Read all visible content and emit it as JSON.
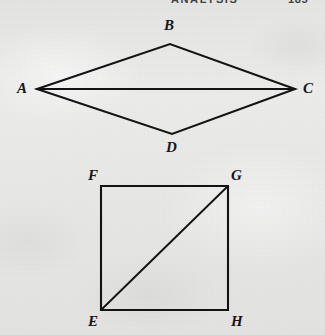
{
  "page": {
    "background_color": "#e9e9e8",
    "ink_color": "#131313",
    "width": 325,
    "height": 335
  },
  "running_head": {
    "title": "ANALYSIS",
    "page_number": "185"
  },
  "figures": [
    {
      "id": "rhombus-abcd",
      "name": "Rhombus ABCD with diagonal AC",
      "shape": "rhombus",
      "vertices": [
        {
          "label": "A",
          "x": 37,
          "y": 89,
          "label_x": 17,
          "label_y": 81
        },
        {
          "label": "B",
          "x": 170,
          "y": 44,
          "label_x": 164,
          "label_y": 18
        },
        {
          "label": "C",
          "x": 295,
          "y": 89,
          "label_x": 303,
          "label_y": 81
        },
        {
          "label": "D",
          "x": 172,
          "y": 134,
          "label_x": 166,
          "label_y": 140
        }
      ],
      "outline_path": "M37,89 L170,44 L295,89 L172,134 Z",
      "diagonals": [
        {
          "label": "AC",
          "path": "M37,89 L295,89"
        }
      ]
    },
    {
      "id": "square-efgh",
      "name": "Square EFGH with diagonal EG",
      "shape": "square",
      "vertices": [
        {
          "label": "F",
          "x": 101,
          "y": 186,
          "label_x": 88,
          "label_y": 168
        },
        {
          "label": "G",
          "x": 228,
          "y": 186,
          "label_x": 231,
          "label_y": 168
        },
        {
          "label": "E",
          "x": 101,
          "y": 310,
          "label_x": 88,
          "label_y": 314
        },
        {
          "label": "H",
          "x": 228,
          "y": 310,
          "label_x": 231,
          "label_y": 314
        }
      ],
      "outline_path": "M101,186 L228,186 L228,310 L101,310 Z",
      "diagonals": [
        {
          "label": "EG",
          "path": "M101,310 L228,186"
        }
      ]
    }
  ]
}
